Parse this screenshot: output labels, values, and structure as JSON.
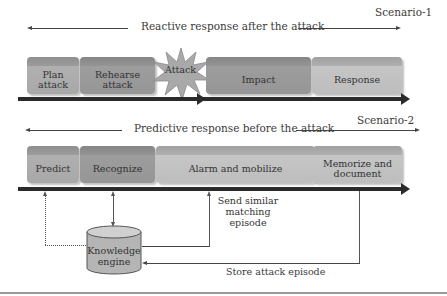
{
  "scenario1": {
    "label": "Scenario-1",
    "caption": "Reactive response after the attack",
    "stages": [
      "Plan attack",
      "Rehearse attack",
      "Attack",
      "Impact",
      "Response"
    ],
    "plan_line1": "Plan",
    "plan_line2": "attack",
    "rehearse_line1": "Rehearse",
    "rehearse_line2": "attack"
  },
  "scenario2": {
    "label": "Scenario-2",
    "caption": "Predictive response before the attack",
    "stages": [
      "Predict",
      "Recognize",
      "Alarm and mobilize",
      "Memorize and document"
    ],
    "memorize_line1": "Memorize and",
    "memorize_line2": "document"
  },
  "knowledge_engine": {
    "line1": "Knowledge",
    "line2": "engine"
  },
  "annotations": {
    "send_line1": "Send similar",
    "send_line2": "matching",
    "send_line3": "episode",
    "store": "Store attack episode"
  }
}
